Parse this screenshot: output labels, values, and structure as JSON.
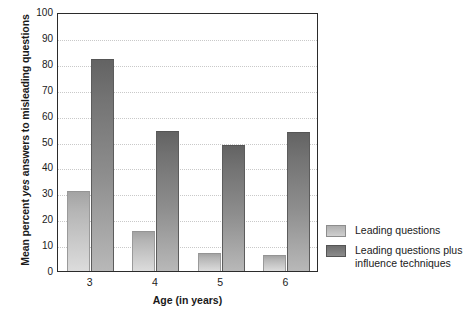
{
  "chart_data": {
    "type": "bar",
    "title": "",
    "categories": [
      "3",
      "4",
      "5",
      "6"
    ],
    "series": [
      {
        "name": "Leading questions",
        "values": [
          31,
          15.5,
          7,
          6
        ],
        "color": "#c2c2c2"
      },
      {
        "name": "Leading questions plus influence techniques",
        "values": [
          82,
          54,
          48.5,
          53.5
        ],
        "color": "#7d7d7d"
      }
    ],
    "xlabel": "Age (in years)",
    "ylabel": "Mean percent yes answers to misleading questions",
    "ylim": [
      0,
      100
    ],
    "yticks": [
      0,
      10,
      20,
      30,
      40,
      50,
      60,
      70,
      80,
      90,
      100
    ],
    "grid": true,
    "legend_position": "right"
  },
  "axes": {
    "y_title_prefix": "Mean percent ",
    "y_title_italic": "yes",
    "y_title_suffix": " answers to misleading questions",
    "x_title": "Age (in years)",
    "y_tick_labels": [
      "100",
      "90",
      "80",
      "70",
      "60",
      "50",
      "40",
      "30",
      "20",
      "10",
      "0"
    ],
    "x_tick_labels": [
      "3",
      "4",
      "5",
      "6"
    ]
  },
  "legend": {
    "items": [
      {
        "label": "Leading questions",
        "swatch": "light-gray-gradient"
      },
      {
        "label": "Leading questions plus influence techniques",
        "swatch": "dark-gray-gradient"
      }
    ]
  }
}
